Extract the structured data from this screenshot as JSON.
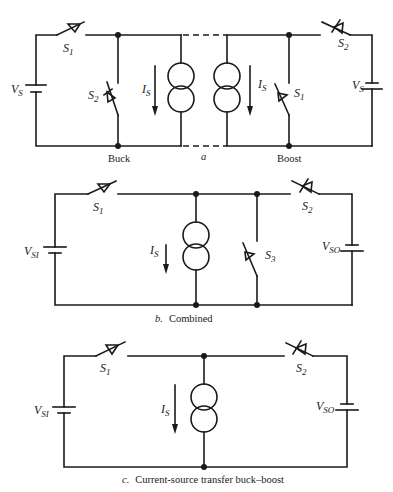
{
  "figure": {
    "panels": [
      {
        "id": "a",
        "caption_letter": "a",
        "sub_labels": [
          "Buck",
          "Boost"
        ],
        "left": {
          "source_label": "V",
          "source_sub": "S",
          "switch1_label": "S",
          "switch1_sub": "1",
          "switch2_label": "S",
          "switch2_sub": "2",
          "current_label": "I",
          "current_sub": "S"
        },
        "right": {
          "source_label": "V",
          "source_sub": "S",
          "switch1_label": "S",
          "switch1_sub": "1",
          "switch2_label": "S",
          "switch2_sub": "2",
          "current_label": "I",
          "current_sub": "S"
        }
      },
      {
        "id": "b",
        "caption_letter": "b.",
        "caption_text": "Combined",
        "input_label": "V",
        "input_sub": "SI",
        "output_label": "V",
        "output_sub": "SO",
        "switch1_label": "S",
        "switch1_sub": "1",
        "switch2_label": "S",
        "switch2_sub": "2",
        "switch3_label": "S",
        "switch3_sub": "3",
        "current_label": "I",
        "current_sub": "S"
      },
      {
        "id": "c",
        "caption_letter": "c.",
        "caption_text": "Current-source transfer buck–boost",
        "input_label": "V",
        "input_sub": "SI",
        "output_label": "V",
        "output_sub": "SO",
        "switch1_label": "S",
        "switch1_sub": "1",
        "switch2_label": "S",
        "switch2_sub": "2",
        "current_label": "I",
        "current_sub": "S"
      }
    ]
  }
}
